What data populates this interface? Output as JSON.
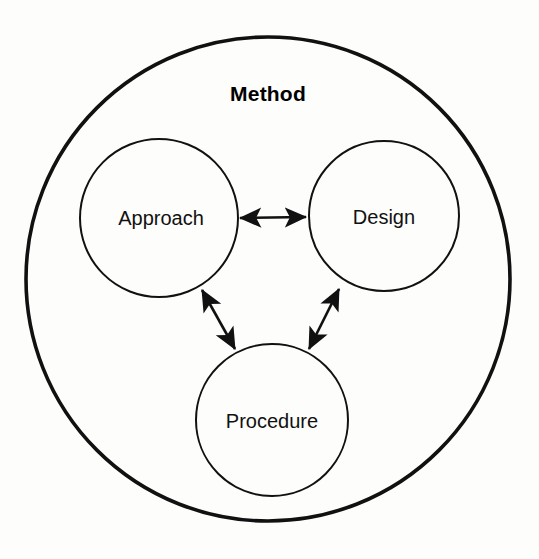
{
  "diagram": {
    "title": "Method",
    "type": "concentric-circle-relationship-diagram",
    "outer_container": {
      "label": "Method",
      "shape": "circle",
      "center_x": 268,
      "center_y": 279,
      "radius": 242,
      "stroke_color": "#111111",
      "fill_color": "#ffffff",
      "label_x": 268,
      "label_y": 95
    },
    "nodes": [
      {
        "id": "approach",
        "label": "Approach",
        "shape": "circle",
        "center_x": 159,
        "center_y": 218,
        "radius": 79,
        "stroke_color": "#111111",
        "fill_color": "#ffffff"
      },
      {
        "id": "design",
        "label": "Design",
        "shape": "circle",
        "center_x": 384,
        "center_y": 216,
        "radius": 75,
        "stroke_color": "#111111",
        "fill_color": "#ffffff"
      },
      {
        "id": "procedure",
        "label": "Procedure",
        "shape": "circle",
        "center_x": 272,
        "center_y": 420,
        "radius": 76,
        "stroke_color": "#111111",
        "fill_color": "#ffffff"
      }
    ],
    "connectors": [
      {
        "id": "approach-design",
        "from": "approach",
        "to": "design",
        "style": "double-headed-arrow",
        "x1": 240,
        "y1": 218,
        "x2": 306,
        "y2": 217
      },
      {
        "id": "approach-procedure",
        "from": "approach",
        "to": "procedure",
        "style": "double-headed-arrow",
        "x1": 202,
        "y1": 290,
        "x2": 235,
        "y2": 349
      },
      {
        "id": "design-procedure",
        "from": "design",
        "to": "procedure",
        "style": "double-headed-arrow",
        "x1": 339,
        "y1": 289,
        "x2": 309,
        "y2": 349
      }
    ],
    "canvas": {
      "width": 539,
      "height": 559,
      "background_color": "#fdfdfc"
    }
  }
}
